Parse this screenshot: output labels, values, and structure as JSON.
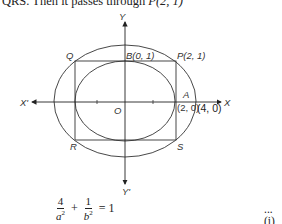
{
  "header": {
    "text_prefix": "QRS. Then it passes through ",
    "point": "P(2, 1)"
  },
  "figure": {
    "axes": {
      "x_positive_label": "X",
      "x_negative_label": "X'",
      "y_positive_label": "Y",
      "y_negative_label": "Y'",
      "origin_label": "O"
    },
    "points": {
      "Q": "Q",
      "P": "P(2, 1)",
      "B": "B(0, 1)",
      "R": "R",
      "S": "S",
      "A": "A",
      "A_coord": "(2, 0)",
      "outer_vertex": "(4, 0)"
    },
    "shapes": {
      "inner_ellipse": {
        "semi_major": 2,
        "semi_minor": 1
      },
      "rectangle": "PQRS",
      "outer_ellipse": {
        "passes_through": "P(2, 1)",
        "vertex": "(4, 0)"
      }
    }
  },
  "equation": {
    "term1_num": "4",
    "term1_den": "a",
    "term2_num": "1",
    "term2_den": "b",
    "exponent": "2",
    "plus": "+",
    "rhs": "= 1",
    "tag": "...(i)"
  }
}
